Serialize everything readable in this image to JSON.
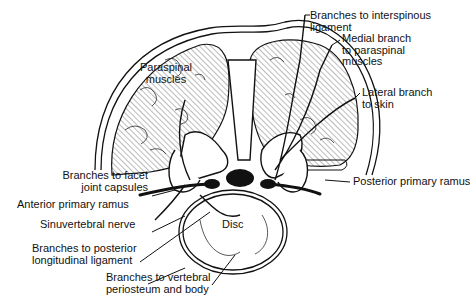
{
  "figure": {
    "type": "anatomical cross-section",
    "labels": {
      "paraspinal_muscles": [
        "Paraspinal",
        "muscles"
      ],
      "branches_interspinous": [
        "Branches to interspinous",
        "ligament"
      ],
      "medial_branch": [
        "Medial branch",
        "to paraspinal",
        "muscles"
      ],
      "lateral_branch": [
        "Lateral branch",
        "to skin"
      ],
      "posterior_primary_ramus": "Posterior primary ramus",
      "branches_facet": [
        "Branches to facet",
        "joint capsules"
      ],
      "anterior_primary_ramus": "Anterior primary ramus",
      "sinuvertebral_nerve": "Sinuvertebral nerve",
      "branches_posterior_longitudinal": [
        "Branches to posterior",
        "longitudinal ligament"
      ],
      "branches_vertebral_periosteum": [
        "Branches to vertebral",
        "periosteum and body"
      ],
      "disc": "Disc"
    },
    "colors": {
      "ink": "#111111",
      "background": "#ffffff",
      "hatch": "#555555"
    }
  }
}
